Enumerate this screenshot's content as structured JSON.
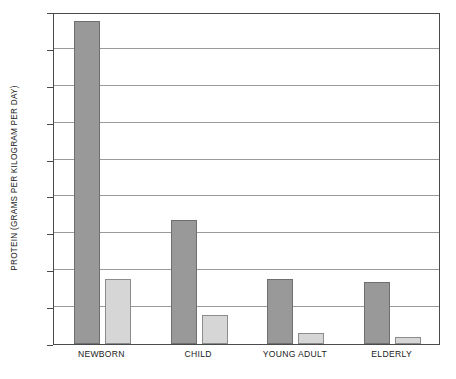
{
  "chart_data": {
    "type": "bar",
    "title": "",
    "xlabel": "",
    "ylabel": "PROTEIN (GRAMS PER KILOGRAM PER DAY)",
    "categories": [
      "NEWBORN",
      "CHILD",
      "YOUNG ADULT",
      "ELDERLY"
    ],
    "series": [
      {
        "name": "dark",
        "values": [
          17.5,
          6.7,
          3.5,
          3.35
        ]
      },
      {
        "name": "light",
        "values": [
          3.5,
          1.6,
          0.6,
          0.4
        ]
      }
    ],
    "ylim": [
      0,
      18
    ],
    "yticks": [
      0,
      2,
      4,
      6,
      8,
      10,
      12,
      14,
      16,
      18
    ],
    "ytick_labels": [
      "0",
      "2",
      "4",
      "6",
      "8",
      "10",
      "12",
      "14",
      "16",
      "18"
    ],
    "grid": true,
    "legend": "none",
    "colors": {
      "dark_bar": "#999999",
      "dark_bar_edge": "#6f6f6f",
      "light_bar": "#d6d6d6",
      "light_bar_edge": "#8c8c8c",
      "gridline": "#9a9a9a",
      "frame": "#4a4a4a",
      "text": "#1a1a1a",
      "background": "#ffffff"
    }
  }
}
